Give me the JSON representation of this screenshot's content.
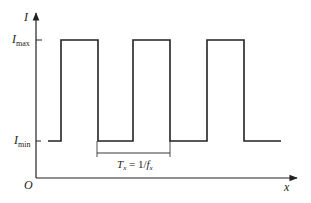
{
  "diagram": {
    "axes": {
      "y_label": "I",
      "x_label": "x",
      "origin_label": "O"
    },
    "levels": {
      "max_label": {
        "main": "I",
        "sub": "max"
      },
      "min_label": {
        "main": "I",
        "sub": "min"
      }
    },
    "period_label": {
      "T": "T",
      "T_sub": "x",
      "eq": " = 1/",
      "f": "f",
      "f_sub": "x"
    },
    "waveform": {
      "type": "square",
      "pulse_count": 3,
      "duty_cycle": 0.5
    },
    "colors": {
      "line": "#222222",
      "background": "#ffffff"
    }
  }
}
